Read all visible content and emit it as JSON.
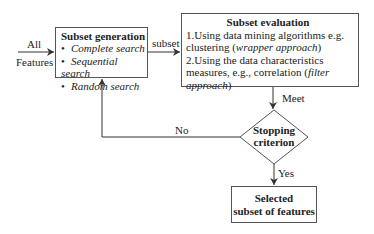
{
  "diagram": {
    "input": {
      "line1": "All",
      "line2": "Features"
    },
    "subset_generation": {
      "title": "Subset generation",
      "items": [
        "Complete search",
        "Sequential search",
        "Random search"
      ]
    },
    "edge_subset": "subset",
    "subset_evaluation": {
      "title": "Subset evaluation",
      "line1": "1.Using data mining algorithms e.g.",
      "line2_prefix": "clustering (",
      "line2_italic": "wrapper approach",
      "line2_suffix": ")",
      "line3": "2.Using the data characteristics",
      "line4_prefix": "measures, e.g., correlation (",
      "line4_italic": "filter",
      "line5_italic": "approach",
      "line5_suffix": ")"
    },
    "edge_meet": "Meet",
    "decision": {
      "line1": "Stopping",
      "line2": "criterion"
    },
    "edge_no": "No",
    "edge_yes": "Yes",
    "output": {
      "line1": "Selected",
      "line2": "subset of features"
    }
  }
}
